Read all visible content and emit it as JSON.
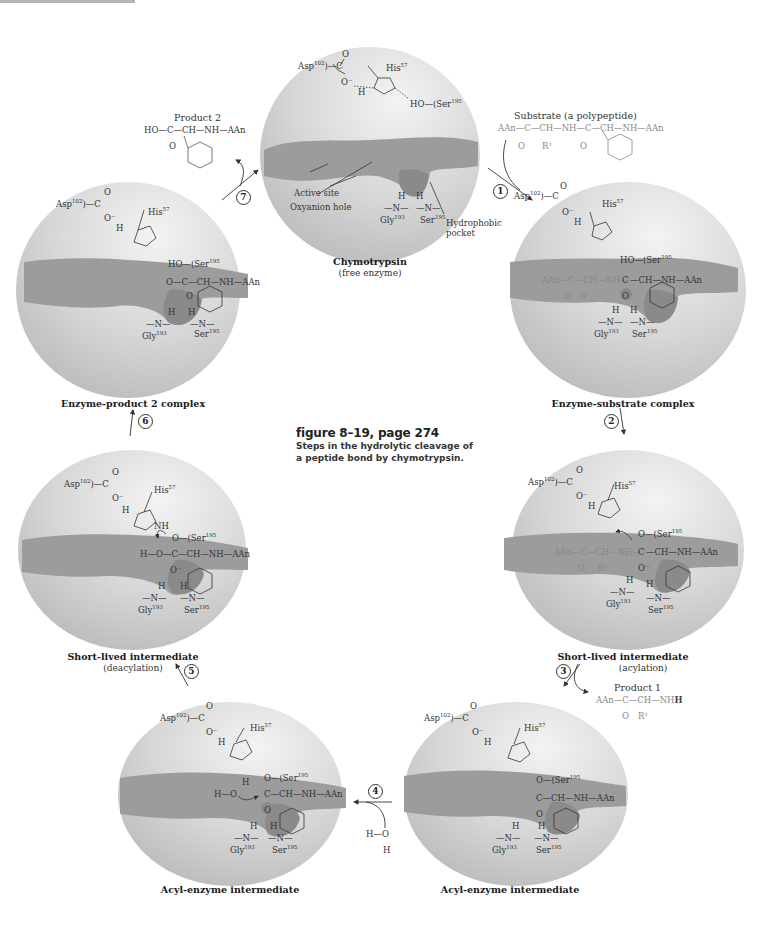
{
  "caption": {
    "figure": "figure 8–19, page 274",
    "description": "Steps in the hydrolytic cleavage of a peptide bond by chymotrypsin."
  },
  "residues": {
    "asp": "Asp",
    "asp_num": "102",
    "his": "His",
    "his_num": "57",
    "ser": "Ser",
    "ser_num": "195",
    "gly": "Gly",
    "gly_num": "193"
  },
  "panels": [
    {
      "id": "free-enzyme",
      "title": "Chymotrypsin",
      "subtitle": "(free enzyme)",
      "annotations": {
        "active_site": "Active site",
        "oxyanion_hole": "Oxyanion hole",
        "hydrophobic_pocket_1": "Hydrophobic",
        "hydrophobic_pocket_2": "pocket"
      }
    },
    {
      "id": "enzyme-substrate",
      "title": "Enzyme-substrate complex",
      "subtitle": ""
    },
    {
      "id": "acylation",
      "title": "Short-lived intermediate",
      "subtitle": "(acylation)"
    },
    {
      "id": "acyl-enzyme-right",
      "title": "Acyl-enzyme intermediate",
      "subtitle": ""
    },
    {
      "id": "acyl-enzyme-left",
      "title": "Acyl-enzyme intermediate",
      "subtitle": ""
    },
    {
      "id": "deacylation",
      "title": "Short-lived intermediate",
      "subtitle": "(deacylation)"
    },
    {
      "id": "enzyme-product2",
      "title": "Enzyme-product 2 complex",
      "subtitle": ""
    }
  ],
  "steps": [
    "1",
    "2",
    "3",
    "4",
    "5",
    "6",
    "7"
  ],
  "substrate": {
    "title": "Substrate (a polypeptide)",
    "formula": "AAn—C—CH—NH—C—CH—NH—AAn",
    "sub_o": "O",
    "sub_r": "R1",
    "sub_o2": "O"
  },
  "product1": {
    "title": "Product 1",
    "formula": "AAn—C—CH—NH",
    "h": "H",
    "sub_o": "O",
    "sub_r": "R1"
  },
  "product2": {
    "title": "Product 2",
    "formula": "HO—C—CH—NH—AAn",
    "sub_o": "O"
  },
  "water": {
    "top": "H—O",
    "bottom": "H"
  },
  "fragments": {
    "ho_ser": "HO—",
    "o_ser": "O—",
    "peptide_left": "AAn—C—CH—NH—",
    "peptide_right": "—CH—NH—AAn",
    "product_chain": "O—C—CH—NH—AAn",
    "deacyl_chain": "H—O—C—CH—NH—AAn",
    "acyl_chain": "C—CH—NH—AAn",
    "acyl_water": "H—O",
    "c": "C",
    "o": "O",
    "o_minus": "O⁻",
    "h": "H",
    "n": "N",
    "nh": "NH",
    "r1": "R¹",
    "eq_o": "O"
  },
  "colors": {
    "sphere_light": "#e4e4e4",
    "sphere_dark": "#b9b9b9",
    "cleft": "#9c9c9c",
    "pocket": "#8f8f8f",
    "text": "#222222",
    "grey_text": "#888888"
  }
}
